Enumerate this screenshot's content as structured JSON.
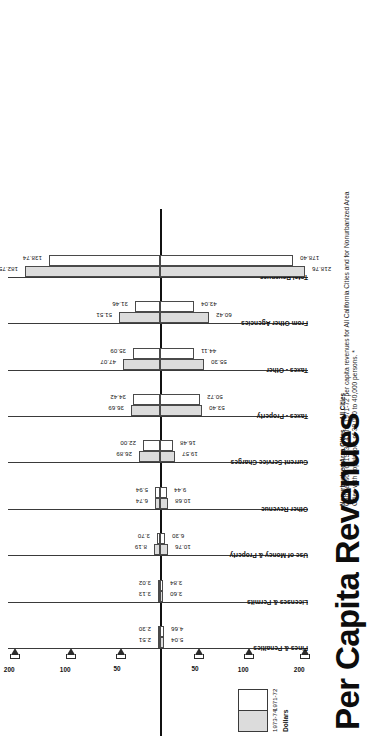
{
  "title": "Per Capita Revenues",
  "caption": "Comparison of 1973-74 and 1971-72 per capita revenues for All California Cities and for Nonurbanized Area Cities with populations of 30,000 to 40,000 persons. *",
  "axis_side_labels": {
    "left": "Nonurbanized Area Cities",
    "right": "All Cities"
  },
  "legend": {
    "series1_label": "1973-74",
    "series2_label": "1971-72",
    "units_label": "Dollars"
  },
  "chart_data": {
    "type": "bar",
    "title": "Per Capita Revenues",
    "subtitle": "Comparison of 1973-74 and 1971-72 per capita revenues for All California Cities and for Nonurbanized Area Cities with populations of 30,000 to 40,000 persons. *",
    "orientation": "diverging-horizontal",
    "xlabel": "Dollars",
    "ylabel": "",
    "grid": false,
    "legend_position": "bottom-left",
    "axis_ticks": [
      200,
      100,
      50,
      0,
      50,
      100,
      200
    ],
    "axis_tick_labels_left": [
      "200",
      "100",
      "50"
    ],
    "axis_tick_labels_right": [
      "50",
      "100",
      "200"
    ],
    "sides": [
      "Nonurbanized Area Cities",
      "All Cities"
    ],
    "categories": [
      "Fines & Penalties",
      "Licenses & Permits",
      "Use of Money & Property",
      "Other Revenue",
      "Current Service Charges",
      "Taxes - Property",
      "Taxes - Other",
      "From Other Agencies",
      "Total Revenues"
    ],
    "series": [
      {
        "name": "1973-74",
        "side_left_values": [
          2.51,
          3.13,
          8.19,
          6.74,
          26.89,
          36.69,
          47.07,
          51.51,
          182.75
        ],
        "side_right_values": [
          5.04,
          3.6,
          10.76,
          10.68,
          19.57,
          53.4,
          55.3,
          60.42,
          218.76
        ]
      },
      {
        "name": "1971-72",
        "side_left_values": [
          2.3,
          3.02,
          3.7,
          5.94,
          22.0,
          34.42,
          35.09,
          31.46,
          138.74
        ],
        "side_right_values": [
          4.66,
          3.84,
          6.3,
          9.44,
          16.48,
          50.72,
          44.11,
          43.04,
          178.4
        ]
      }
    ]
  }
}
